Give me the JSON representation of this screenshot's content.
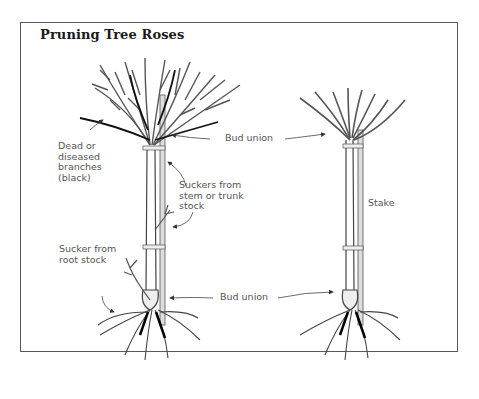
{
  "figure": {
    "title": "Pruning Tree Roses",
    "labels": {
      "dead_branches": "Dead or\ndiseased\nbranches\n(black)",
      "bud_union_top": "Bud union",
      "suckers_stem": "Suckers from\nstem or trunk\nstock",
      "sucker_root": "Sucker from\nroot stock",
      "bud_union_bottom": "Bud union",
      "stake": "Stake"
    },
    "trees": [
      {
        "name": "unpruned tree rose",
        "position": "left"
      },
      {
        "name": "pruned tree rose",
        "position": "right"
      }
    ]
  }
}
